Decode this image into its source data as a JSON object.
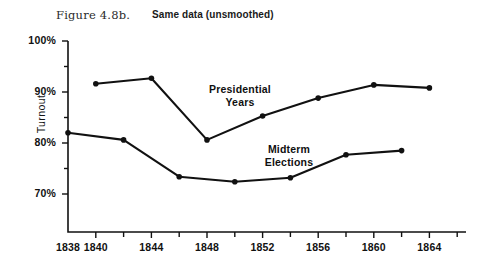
{
  "figure": {
    "number_label": "Figure 4.8b.",
    "subtitle": "Same data (unsmoothed)"
  },
  "chart_data": {
    "type": "line",
    "title": "Same data (unsmoothed)",
    "xlabel": "",
    "ylabel": "Turnout",
    "xlim": [
      1838,
      1866
    ],
    "ylim": [
      67,
      100
    ],
    "grid": false,
    "legend": "inline-annotations",
    "x_major_ticks": [
      1838,
      1840,
      1844,
      1848,
      1852,
      1856,
      1860,
      1864
    ],
    "x_tick_labels": [
      "1838",
      "1840",
      "1844",
      "1848",
      "1852",
      "1856",
      "1860",
      "1864"
    ],
    "x_minor_ticks": [
      1842,
      1846,
      1850,
      1854,
      1858,
      1862,
      1866
    ],
    "y_major_ticks": [
      70,
      80,
      90,
      100
    ],
    "y_tick_labels": [
      "70%",
      "80%",
      "90%",
      "100%"
    ],
    "y_minor_ticks": [
      75,
      85,
      95
    ],
    "series": [
      {
        "name": "Presidential Years",
        "annotation": "Presidential\nYears",
        "x": [
          1840,
          1844,
          1848,
          1852,
          1856,
          1860,
          1864
        ],
        "values": [
          91.6,
          92.7,
          80.6,
          85.3,
          88.8,
          91.4,
          90.8
        ]
      },
      {
        "name": "Midterm Elections",
        "annotation": "Midterm\nElections",
        "x": [
          1838,
          1842,
          1846,
          1850,
          1854,
          1858,
          1862
        ],
        "values": [
          82.0,
          80.6,
          73.4,
          72.4,
          73.2,
          77.7,
          78.5
        ]
      }
    ]
  },
  "axes": {
    "y_title": "Turnout",
    "y_labels": [
      "100%",
      "90%",
      "80%",
      "70%"
    ],
    "x_labels": [
      "1838",
      "1840",
      "1844",
      "1848",
      "1852",
      "1856",
      "1860",
      "1864"
    ]
  },
  "annotations": {
    "presidential": "Presidential\nYears",
    "midterm": "Midterm\nElections"
  },
  "colors": {
    "ink": "#111111",
    "background": "#ffffff"
  }
}
